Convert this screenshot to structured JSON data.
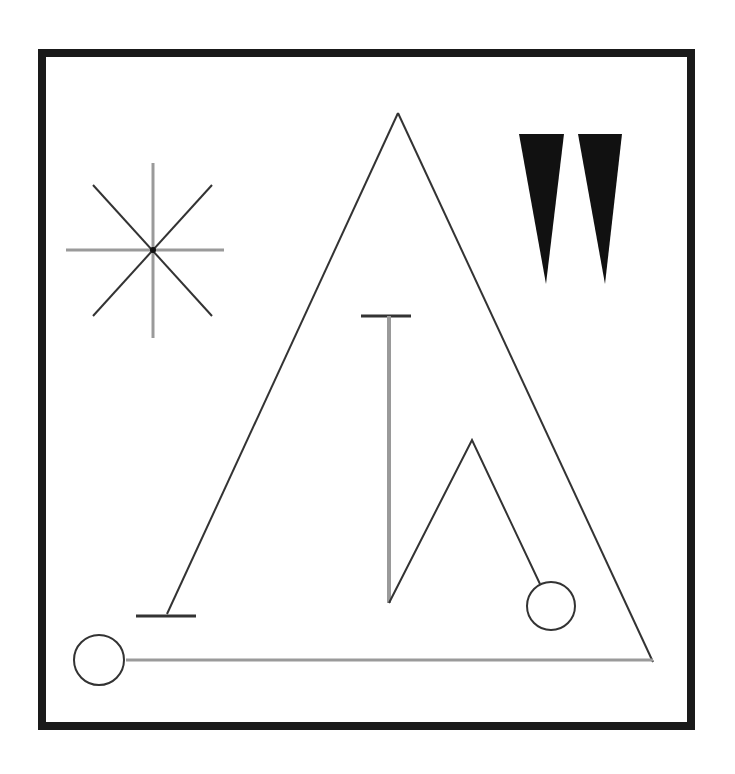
{
  "canvas": {
    "width": 735,
    "height": 774,
    "background": "#ffffff"
  },
  "colors": {
    "frame": "#1a1a1a",
    "dark_line": "#333333",
    "grey_line": "#9a9a9a",
    "fill": "#111111"
  },
  "diagram": {
    "frame": {
      "x": 42,
      "y": 53,
      "width": 649,
      "height": 673,
      "stroke_width": 8
    },
    "star": {
      "center": [
        153,
        250
      ],
      "vertical": {
        "x": 153,
        "y1": 163,
        "y2": 338
      },
      "horizontal": {
        "y": 250,
        "x1": 66,
        "x2": 224
      },
      "diag1": [
        [
          93,
          185
        ],
        [
          212,
          316
        ]
      ],
      "diag2": [
        [
          212,
          185
        ],
        [
          93,
          316
        ]
      ]
    },
    "wedges": [
      {
        "points": [
          [
            519,
            134
          ],
          [
            564,
            134
          ],
          [
            546,
            284
          ]
        ]
      },
      {
        "points": [
          [
            578,
            134
          ],
          [
            622,
            134
          ],
          [
            605,
            284
          ]
        ]
      }
    ],
    "triangle": {
      "apex": [
        398,
        113
      ],
      "bottom_left": [
        167,
        614
      ],
      "bottom_right": [
        653,
        662
      ]
    },
    "tee_bottom": {
      "x1": 136,
      "x2": 196,
      "y": 616
    },
    "baseline": {
      "x1": 126,
      "x2": 653,
      "y": 660
    },
    "circle_left": {
      "cx": 99,
      "cy": 660,
      "r": 25
    },
    "circle_right": {
      "cx": 551,
      "cy": 606,
      "r": 24
    },
    "tee_top": {
      "x1": 361,
      "x2": 411,
      "y": 316
    },
    "stem": {
      "x": 389,
      "y1": 316,
      "y2": 603
    },
    "zigzag": [
      [
        389,
        603
      ],
      [
        472,
        440
      ],
      [
        540,
        584
      ]
    ]
  }
}
